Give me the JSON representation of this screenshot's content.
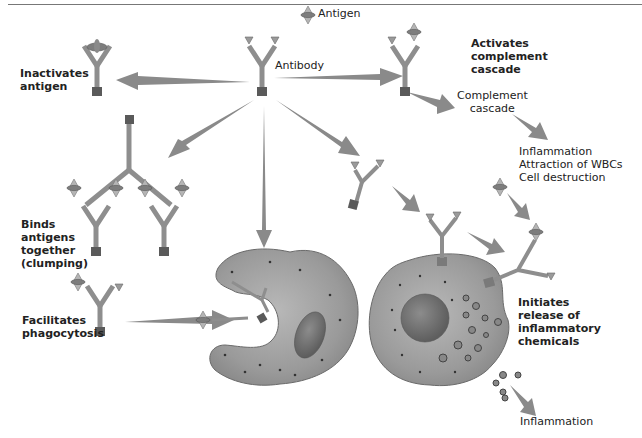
{
  "labels": {
    "antigen": "Antigen",
    "antibody": "Antibody",
    "inactivates": [
      "Inactivates",
      "antigen"
    ],
    "activates": [
      "Activates",
      "complement",
      "cascade"
    ],
    "complement": [
      "Complement",
      "cascade"
    ],
    "effects": [
      "Inflammation",
      "Attraction of WBCs",
      "Cell destruction"
    ],
    "binds": [
      "Binds",
      "antigens",
      "together",
      "(clumping)"
    ],
    "facilitates": [
      "Facilitates",
      "phagocytosis"
    ],
    "initiates": [
      "Initiates",
      "release of",
      "inflammatory",
      "chemicals"
    ],
    "inflammation_bottom": "Inflammation"
  },
  "colors": {
    "antibody_stem": "#9a9a9a",
    "antibody_base": "#5a5a5a",
    "arrow": "#8a8a8a",
    "cell_fill": "#a8a8a8",
    "cell_dark": "#7a7a7a",
    "nucleus": "#6e6e6e"
  }
}
